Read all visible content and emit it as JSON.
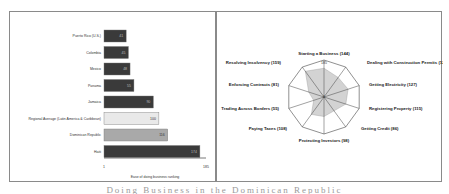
{
  "chart_data": [
    {
      "type": "bar",
      "orientation": "horizontal",
      "title": "",
      "xlabel": "Ease of doing business ranking",
      "ylabel": "",
      "xlim": [
        1,
        185
      ],
      "x_ticks": [
        "1",
        "185"
      ],
      "grid": false,
      "categories": [
        "Puerto Rico (U.S.)",
        "Colombia",
        "Mexico",
        "Panama",
        "Jamaica",
        "Regional Average (Latin America & Caribbean)",
        "Dominican Republic",
        "Haiti"
      ],
      "values": [
        41,
        45,
        48,
        55,
        90,
        100,
        116,
        174
      ],
      "colors": [
        "#3a3a3a",
        "#3a3a3a",
        "#3a3a3a",
        "#3a3a3a",
        "#3a3a3a",
        "#e9e9e9",
        "#a9a9a9",
        "#3a3a3a"
      ]
    },
    {
      "type": "radar",
      "title": "",
      "scale": {
        "outer": "185",
        "center": "1"
      },
      "grid": true,
      "categories": [
        "Starting a Business (144)",
        "Dealing with Construction Permits (121)",
        "Getting Electricity (127)",
        "Registering Property (115)",
        "Getting Credit (86)",
        "Protecting Investors (98)",
        "Paying Taxes (108)",
        "Trading Across Borders (55)",
        "Enforcing Contracts (81)",
        "Resolving Insolvency (159)"
      ],
      "values": [
        144,
        121,
        127,
        115,
        86,
        98,
        108,
        55,
        81,
        159
      ],
      "fill_color": "#d3d3d3"
    }
  ],
  "bar_chart": {
    "axis_min_label": "1",
    "axis_max_label": "185",
    "axis_title": "Ease of doing business ranking",
    "rows": [
      {
        "label": "Puerto Rico (U.S.)",
        "value": "41"
      },
      {
        "label": "Colombia",
        "value": "45"
      },
      {
        "label": "Mexico",
        "value": "48"
      },
      {
        "label": "Panama",
        "value": "55"
      },
      {
        "label": "Jamaica",
        "value": "90"
      },
      {
        "label": "Regional Average (Latin America & Caribbean)",
        "value": "100"
      },
      {
        "label": "Dominican Republic",
        "value": "116"
      },
      {
        "label": "Haiti",
        "value": "174"
      }
    ]
  },
  "radar_chart": {
    "outer_label": "185",
    "center_label": "1",
    "labels": [
      "Starting a Business (144)",
      "Dealing with Construction Permits (121)",
      "Getting Electricity (127)",
      "Registering Property (115)",
      "Getting Credit (86)",
      "Protecting Investors (98)",
      "Paying Taxes (108)",
      "Trading Across Borders (55)",
      "Enforcing Contracts (81)",
      "Resolving Insolvency (159)"
    ]
  },
  "caption": "Doing Business in the Dominican Republic"
}
